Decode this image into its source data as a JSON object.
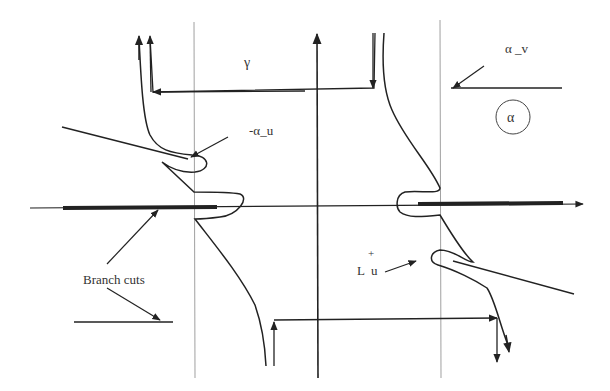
{
  "diagram": {
    "labels": {
      "gamma": "γ",
      "alpha_v": "α _v",
      "alpha_circled": "α",
      "minus_alpha_u": "-α_u",
      "branch_cuts": "Branch cuts",
      "L_u_plus": "+",
      "L_u": "L  u"
    },
    "colors": {
      "stroke": "#222222",
      "thin": "#777777",
      "background": "#ffffff"
    }
  }
}
